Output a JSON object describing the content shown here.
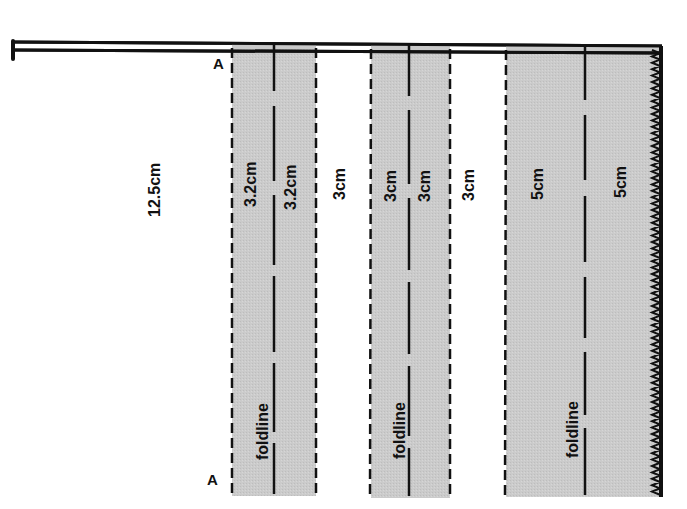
{
  "diagram": {
    "colors": {
      "shade": "#c9c9c9",
      "line": "#111111",
      "background": "#ffffff"
    },
    "points": [
      {
        "id": "A-top",
        "label": "A"
      },
      {
        "id": "A-bottom",
        "label": "A"
      }
    ],
    "sections": [
      {
        "id": "plain",
        "label": "12.5cm",
        "shaded": false
      },
      {
        "id": "pleat1-left",
        "label": "3.2cm",
        "shaded": true
      },
      {
        "id": "pleat1-right",
        "label": "3.2cm",
        "shaded": true
      },
      {
        "id": "gap1",
        "label": "3cm",
        "shaded": false
      },
      {
        "id": "pleat2-left",
        "label": "3cm",
        "shaded": true
      },
      {
        "id": "pleat2-right",
        "label": "3cm",
        "shaded": true
      },
      {
        "id": "gap2",
        "label": "3cm",
        "shaded": false
      },
      {
        "id": "hem-left",
        "label": "5cm",
        "shaded": true
      },
      {
        "id": "hem-right",
        "label": "5cm",
        "shaded": true
      }
    ],
    "foldlines": [
      {
        "id": "fold1",
        "label": "foldline"
      },
      {
        "id": "fold2",
        "label": "foldline"
      },
      {
        "id": "fold3",
        "label": "foldline"
      }
    ],
    "edges": {
      "top": "double-line waistband edge",
      "right": "zigzag pinked edge",
      "pleat_edges": "dashed stitch lines"
    }
  }
}
